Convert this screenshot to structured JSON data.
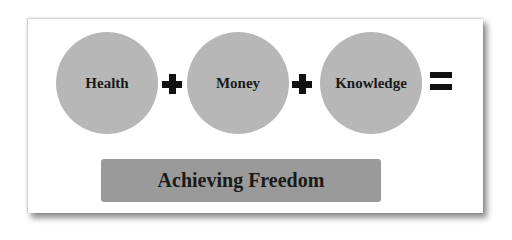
{
  "diagram": {
    "terms": [
      {
        "label": "Health"
      },
      {
        "label": "Money"
      },
      {
        "label": "Knowledge"
      }
    ],
    "operators": [
      "+",
      "+",
      "="
    ],
    "result": "Achieving Freedom",
    "colors": {
      "circle": "#b7b7b7",
      "banner": "#9a9a9a",
      "text": "#1a1a1a",
      "operator": "#111111"
    }
  }
}
